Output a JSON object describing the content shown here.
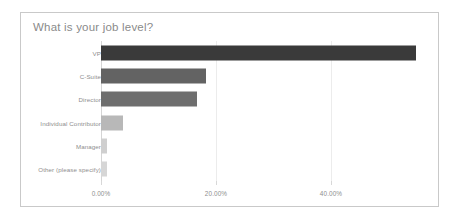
{
  "chart_data": {
    "type": "bar",
    "orientation": "horizontal",
    "title": "What is your job level?",
    "xlabel": "",
    "ylabel": "",
    "grid": true,
    "legend": false,
    "xlim": [
      0,
      57
    ],
    "categories": [
      "VP",
      "C-Suite",
      "Director",
      "Individual Contributor",
      "Manager",
      "Other (please specify)"
    ],
    "values": [
      54.8,
      18.3,
      16.7,
      3.8,
      1.0,
      1.0
    ],
    "tick_labels": [
      "0.00%",
      "20.00%",
      "40.00%"
    ],
    "tick_values": [
      0,
      20,
      40
    ],
    "bar_colors": [
      "#3a3a3a",
      "#636363",
      "#6e6e6e",
      "#b8b8b8",
      "#cfcfcf",
      "#d6d6d6"
    ]
  },
  "card": {
    "border_color": "#c9c9c9",
    "background": "#ffffff"
  },
  "axis": {
    "label_color": "#8e8e8e",
    "gridline_color": "#ececec"
  }
}
